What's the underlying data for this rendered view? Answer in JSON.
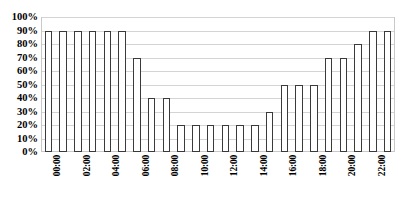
{
  "chart_data": {
    "type": "bar",
    "title": "",
    "xlabel": "",
    "ylabel": "",
    "ylim": [
      0,
      100
    ],
    "ytick_labels": [
      "100%",
      "90%",
      "80%",
      "70%",
      "60%",
      "50%",
      "40%",
      "30%",
      "20%",
      "10%",
      "0%"
    ],
    "ytick_values": [
      100,
      90,
      80,
      70,
      60,
      50,
      40,
      30,
      20,
      10,
      0
    ],
    "grid": true,
    "legend": "none",
    "categories": [
      "00:00",
      "01:00",
      "02:00",
      "03:00",
      "04:00",
      "05:00",
      "06:00",
      "07:00",
      "08:00",
      "09:00",
      "10:00",
      "11:00",
      "12:00",
      "13:00",
      "14:00",
      "15:00",
      "16:00",
      "17:00",
      "18:00",
      "19:00",
      "20:00",
      "21:00",
      "22:00",
      "23:00"
    ],
    "visible_tick_labels": [
      "00:00",
      "02:00",
      "04:00",
      "06:00",
      "08:00",
      "10:00",
      "12:00",
      "14:00",
      "16:00",
      "18:00",
      "20:00",
      "22:00"
    ],
    "values": [
      90,
      90,
      90,
      90,
      90,
      90,
      70,
      40,
      40,
      20,
      20,
      20,
      20,
      20,
      20,
      30,
      50,
      50,
      50,
      70,
      70,
      80,
      90,
      90
    ],
    "bar_fill_color": "#ffffff",
    "bar_border_color": "#3a3a3a",
    "gridline_color": "#d4d4d4",
    "plot_border_color": "#c9c9c9",
    "background_color": "#ffffff"
  },
  "caption": {
    "text": ""
  }
}
